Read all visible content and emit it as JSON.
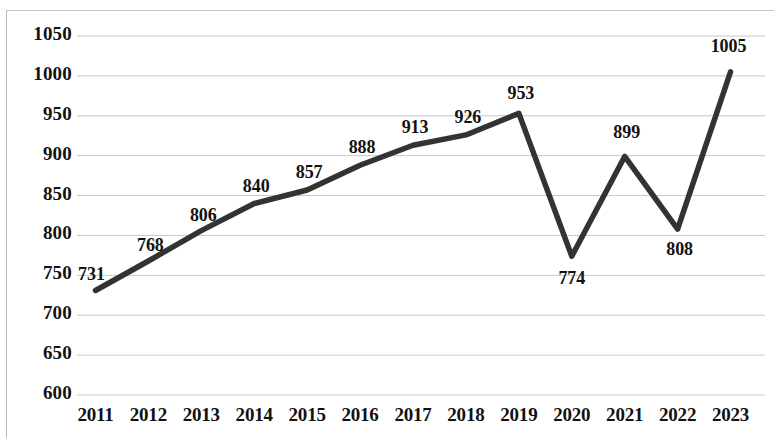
{
  "chart_data": {
    "type": "line",
    "title": "",
    "subtitle": "",
    "xlabel": "",
    "ylabel": "",
    "categories": [
      "2011",
      "2012",
      "2013",
      "2014",
      "2015",
      "2016",
      "2017",
      "2018",
      "2019",
      "2020",
      "2021",
      "2022",
      "2023"
    ],
    "values": [
      731,
      768,
      806,
      840,
      857,
      888,
      913,
      926,
      953,
      774,
      899,
      808,
      1005
    ],
    "series": [
      {
        "name": "",
        "values": [
          731,
          768,
          806,
          840,
          857,
          888,
          913,
          926,
          953,
          774,
          899,
          808,
          1005
        ]
      }
    ],
    "data_labels": [
      "731",
      "768",
      "806",
      "840",
      "857",
      "888",
      "913",
      "926",
      "953",
      "774",
      "899",
      "808",
      "1005"
    ],
    "ylim": [
      600,
      1050
    ],
    "ytick_values": [
      600,
      650,
      700,
      750,
      800,
      850,
      900,
      950,
      1000,
      1050
    ],
    "ytick_labels": [
      "600",
      "650",
      "700",
      "750",
      "800",
      "850",
      "900",
      "950",
      "1000",
      "1050"
    ],
    "xtick_labels": [
      "2011",
      "2012",
      "2013",
      "2014",
      "2015",
      "2016",
      "2017",
      "2018",
      "2019",
      "2020",
      "2021",
      "2022",
      "2023"
    ],
    "grid": true,
    "grid_axis": "y",
    "legend": false,
    "legend_position": "none",
    "markers": false,
    "annotations": [],
    "colors": {
      "line": "#333333",
      "grid": "#c8c8c8",
      "text": "#111111",
      "background": "#ffffff",
      "frame": "#bcbcbc"
    },
    "line_width_px": 5.5
  }
}
